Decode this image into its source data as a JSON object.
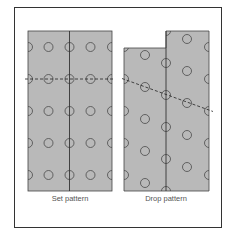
{
  "figure": {
    "frame_color": "#333333",
    "panel_fill": "#b9b9b9",
    "line_color": "#333333",
    "circle_color": "#4a4a4a"
  },
  "panels": [
    {
      "id": "set",
      "label": "Set pattern"
    },
    {
      "id": "drop",
      "label": "Drop pattern"
    }
  ]
}
